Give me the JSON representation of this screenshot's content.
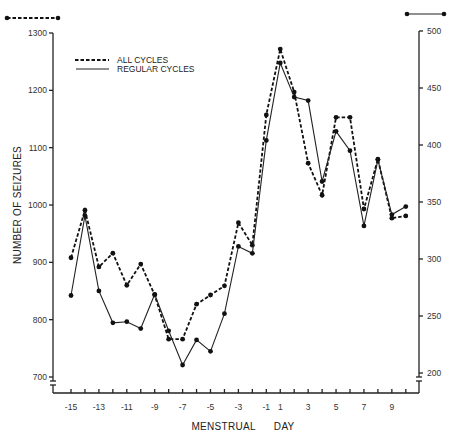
{
  "chart_data": {
    "type": "line",
    "title": "",
    "xlabel": "MENSTRUAL      DAY",
    "ylabel": "NUMBER OF SEIZURES",
    "x": [
      -15,
      -14,
      -13,
      -12,
      -11,
      -10,
      -9,
      -8,
      -7,
      -6,
      -5,
      -4,
      -3,
      -2,
      -1,
      1,
      2,
      3,
      4,
      5,
      6,
      7,
      8,
      9,
      10
    ],
    "x_tick_labels": [
      "-15",
      "-13",
      "-11",
      "-9",
      "-7",
      "-5",
      "-3",
      "-1",
      "1",
      "3",
      "5",
      "7",
      "9"
    ],
    "left_axis": {
      "ylim": [
        700,
        1300
      ],
      "ticks": [
        700,
        800,
        900,
        1000,
        1100,
        1200,
        1300
      ],
      "series_marker": "dashed"
    },
    "right_axis": {
      "ylim": [
        200,
        500
      ],
      "ticks": [
        200,
        250,
        300,
        350,
        400,
        450,
        500
      ],
      "series_marker": "solid"
    },
    "legend": {
      "placement": "top-left",
      "entries": [
        "ALL CYCLES",
        "REGULAR CYCLES"
      ]
    },
    "series": [
      {
        "name": "ALL CYCLES",
        "axis": "left",
        "style": "dashed",
        "values": [
          908,
          991,
          892,
          916,
          860,
          897,
          843,
          766,
          766,
          827,
          843,
          859,
          969,
          930,
          1157,
          1272,
          1197,
          1073,
          1017,
          1153,
          1153,
          993,
          1080,
          977,
          981
        ]
      },
      {
        "name": "REGULAR CYCLES",
        "axis": "right",
        "style": "solid",
        "values": [
          268,
          338,
          272,
          244,
          245,
          239,
          269,
          237,
          207,
          229,
          219,
          252,
          311,
          305,
          404,
          472,
          442,
          439,
          368,
          412,
          395,
          329,
          387,
          339,
          346
        ]
      }
    ],
    "grid": false
  }
}
